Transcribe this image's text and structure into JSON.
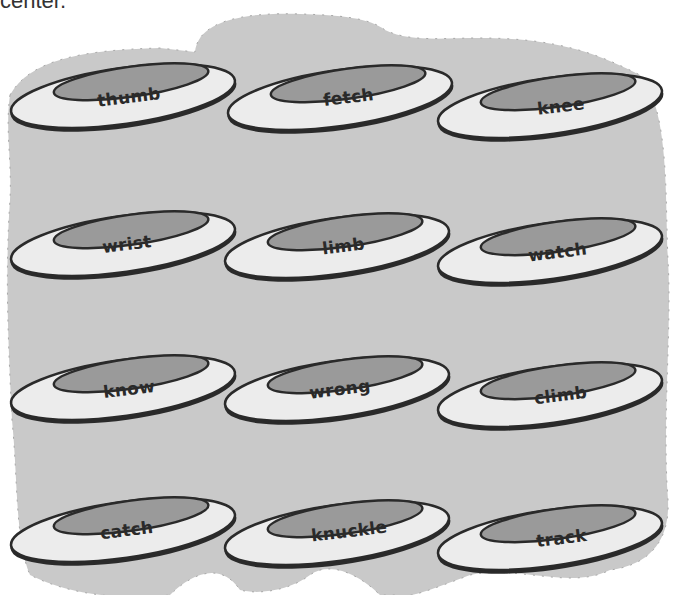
{
  "header": {
    "partial_text": "center."
  },
  "colors": {
    "background_blob": "#c9c9c9",
    "disc_rim": "#ececec",
    "disc_inner": "#9a9a9a",
    "outline": "#2a2a2a",
    "tick": "#8a8a8a"
  },
  "discs": [
    {
      "label": "thumb",
      "x": 5,
      "y": 48,
      "lx": 97,
      "ly": 101
    },
    {
      "label": "fetch",
      "x": 222,
      "y": 50,
      "lx": 323,
      "ly": 101
    },
    {
      "label": "knee",
      "x": 432,
      "y": 58,
      "lx": 537,
      "ly": 110
    },
    {
      "label": "wrist",
      "x": 5,
      "y": 196,
      "lx": 102,
      "ly": 248
    },
    {
      "label": "limb",
      "x": 219,
      "y": 198,
      "lx": 322,
      "ly": 250
    },
    {
      "label": "watch",
      "x": 432,
      "y": 203,
      "lx": 528,
      "ly": 256
    },
    {
      "label": "know",
      "x": 5,
      "y": 340,
      "lx": 103,
      "ly": 393
    },
    {
      "label": "wrong",
      "x": 219,
      "y": 341,
      "lx": 309,
      "ly": 393
    },
    {
      "label": "climb",
      "x": 432,
      "y": 347,
      "lx": 534,
      "ly": 399
    },
    {
      "label": "catch",
      "x": 5,
      "y": 482,
      "lx": 100,
      "ly": 534
    },
    {
      "label": "knuckle",
      "x": 219,
      "y": 485,
      "lx": 311,
      "ly": 535
    },
    {
      "label": "track",
      "x": 432,
      "y": 490,
      "lx": 536,
      "ly": 542
    }
  ]
}
